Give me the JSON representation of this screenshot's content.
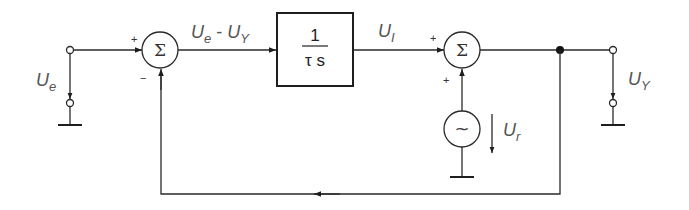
{
  "diagram": {
    "type": "block-diagram",
    "colors": {
      "line": "#2a2a2a",
      "text": "#555555",
      "background": "#ffffff"
    },
    "labels": {
      "input_voltage": "U",
      "input_voltage_sub": "e",
      "error_signal_a": "U",
      "error_signal_a_sub": "e",
      "error_signal_minus": " - ",
      "error_signal_b": "U",
      "error_signal_b_sub": "Y",
      "integrator_out": "U",
      "integrator_out_sub": "I",
      "disturbance": "U",
      "disturbance_sub": "r",
      "output_voltage": "U",
      "output_voltage_sub": "Y"
    },
    "blocks": {
      "summer1": {
        "symbol": "Σ",
        "sign_top": "+",
        "sign_bottom": "−"
      },
      "integrator": {
        "numerator": "1",
        "denominator": "τ s"
      },
      "summer2": {
        "symbol": "Σ",
        "sign_left": "+",
        "sign_bottom": "+"
      },
      "source": {
        "symbol": "~"
      }
    }
  }
}
